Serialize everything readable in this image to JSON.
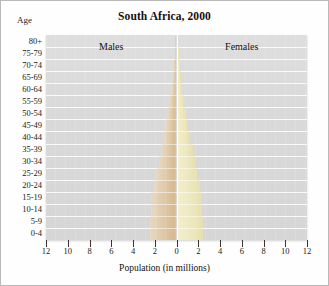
{
  "chart_data": {
    "type": "bar",
    "subtype": "population-pyramid",
    "title": "South Africa, 2000",
    "xlabel": "Population (in millions)",
    "ylabel": "Age",
    "grid": true,
    "legend_position": "inside-top",
    "xlim": [
      -12,
      12
    ],
    "xticks": [
      -12,
      -10,
      -8,
      -6,
      -4,
      -2,
      0,
      2,
      4,
      6,
      8,
      10,
      12
    ],
    "xticklabels": [
      "12",
      "10",
      "8",
      "6",
      "4",
      "2",
      "0",
      "2",
      "4",
      "6",
      "8",
      "10",
      "12"
    ],
    "categories": [
      "0-4",
      "5-9",
      "10-14",
      "15-19",
      "20-24",
      "25-29",
      "30-34",
      "35-39",
      "40-44",
      "45-49",
      "50-54",
      "55-59",
      "60-64",
      "65-69",
      "70-74",
      "75-79",
      "80+"
    ],
    "series": [
      {
        "name": "Males",
        "color": "#ddc7a6",
        "values": [
          2.45,
          2.42,
          2.38,
          2.3,
          2.1,
          1.85,
          1.62,
          1.4,
          1.18,
          0.96,
          0.76,
          0.58,
          0.45,
          0.33,
          0.23,
          0.14,
          0.1
        ]
      },
      {
        "name": "Females",
        "color": "#ece7bd",
        "values": [
          2.44,
          2.41,
          2.37,
          2.3,
          2.14,
          1.92,
          1.7,
          1.48,
          1.26,
          1.05,
          0.86,
          0.68,
          0.55,
          0.43,
          0.32,
          0.21,
          0.18
        ]
      }
    ]
  },
  "labels": {
    "age_caption": "Age",
    "males": "Males",
    "females": "Females"
  }
}
